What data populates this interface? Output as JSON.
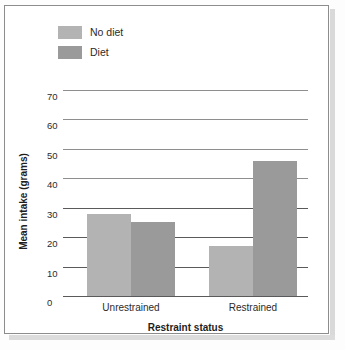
{
  "chart_data": {
    "type": "bar",
    "title": "",
    "xlabel": "Restraint status",
    "ylabel": "Mean intake (grams)",
    "categories": [
      "Unrestrained",
      "Restrained"
    ],
    "series": [
      {
        "name": "No diet",
        "color": "#b3b3b3",
        "values": [
          28,
          17
        ]
      },
      {
        "name": "Diet",
        "color": "#9a9a9a",
        "values": [
          25,
          46
        ]
      }
    ],
    "ylim": [
      0,
      70
    ],
    "yticks": [
      0,
      10,
      20,
      30,
      40,
      50,
      60,
      70
    ],
    "ytick_labels": [
      "0",
      "10",
      "20",
      "30",
      "40",
      "50",
      "60",
      "70"
    ],
    "grid": true,
    "grid_axis": "y",
    "legend_position": "top-left",
    "legend_entries": [
      "No diet",
      "Diet"
    ]
  },
  "axes": {
    "y_title": "Mean intake (grams)",
    "x_title": "Restraint status",
    "tick_0": "0",
    "tick_10": "10",
    "tick_20": "20",
    "tick_30": "30",
    "tick_40": "40",
    "tick_50": "50",
    "tick_60": "60",
    "tick_70": "70",
    "group_1": "Unrestrained",
    "group_2": "Restrained"
  },
  "legend": {
    "entry_1": "No diet",
    "entry_2": "Diet",
    "color_1": "#b3b3b3",
    "color_2": "#9a9a9a"
  }
}
